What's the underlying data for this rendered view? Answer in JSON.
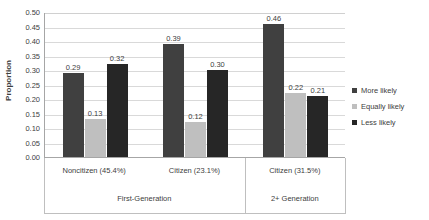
{
  "chart_data": {
    "type": "bar",
    "title": "",
    "xlabel": "",
    "ylabel": "Proportion",
    "ylim": [
      0.0,
      0.5
    ],
    "ytick_labels": [
      "0.50",
      "0.45",
      "0.40",
      "0.35",
      "0.30",
      "0.25",
      "0.20",
      "0.15",
      "0.10",
      "0.05",
      "0.00"
    ],
    "ytick_values": [
      0.5,
      0.45,
      0.4,
      0.35,
      0.3,
      0.25,
      0.2,
      0.15,
      0.1,
      0.05,
      0.0
    ],
    "grid": "horizontal",
    "legend_position": "right",
    "categories": [
      "Noncitizen (45.4%)",
      "Citizen (23.1%)",
      "Citizen (31.5%)"
    ],
    "group_labels": [
      "First-Generation",
      "2+ Generation"
    ],
    "group_spans": [
      2,
      1
    ],
    "series": [
      {
        "name": "More likely",
        "color": "#404040",
        "values": [
          0.29,
          0.39,
          0.46
        ],
        "labels": [
          "0.29",
          "0.39",
          "0.46"
        ]
      },
      {
        "name": "Equally likely",
        "color": "#bfbfbf",
        "values": [
          0.13,
          0.12,
          0.22
        ],
        "labels": [
          "0.13",
          "0.12",
          "0.22"
        ]
      },
      {
        "name": "Less likely",
        "color": "#262626",
        "values": [
          0.32,
          0.3,
          0.21
        ],
        "labels": [
          "0.32",
          "0.30",
          "0.21"
        ]
      }
    ]
  },
  "legend": {
    "items": [
      {
        "label": "More likely",
        "color": "#404040"
      },
      {
        "label": "Equally likely",
        "color": "#bfbfbf"
      },
      {
        "label": "Less likely",
        "color": "#262626"
      }
    ]
  },
  "axes": {
    "y_title": "Proportion"
  }
}
